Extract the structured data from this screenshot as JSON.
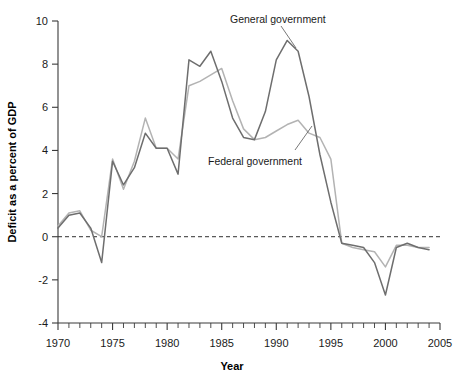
{
  "chart_data": {
    "type": "line",
    "title": "",
    "xlabel": "Year",
    "ylabel": "Deficit as a percent of GDP",
    "xlim": [
      1970,
      2005
    ],
    "ylim": [
      -4,
      10
    ],
    "ytick_labels": [
      "10",
      "8",
      "6",
      "4",
      "2",
      "0",
      "-2",
      "-4"
    ],
    "ytick_values": [
      10,
      8,
      6,
      4,
      2,
      0,
      -2,
      -4
    ],
    "xtick_labels": [
      "1970",
      "1975",
      "1980",
      "1985",
      "1990",
      "1995",
      "2000",
      "2005"
    ],
    "xtick_values": [
      1970,
      1975,
      1980,
      1985,
      1990,
      1995,
      2000,
      2005
    ],
    "grid": false,
    "legend_position": "inline-annotations",
    "zero_reference_line": 0,
    "x": [
      1970,
      1971,
      1972,
      1973,
      1974,
      1975,
      1976,
      1977,
      1978,
      1979,
      1980,
      1981,
      1982,
      1983,
      1984,
      1985,
      1986,
      1987,
      1988,
      1989,
      1990,
      1991,
      1992,
      1993,
      1994,
      1995,
      1996,
      1997,
      1998,
      1999,
      2000,
      2001,
      2002,
      2003,
      2004
    ],
    "series": [
      {
        "name": "General government",
        "color": "#6e6e6e",
        "values": [
          0.4,
          1.0,
          1.1,
          0.4,
          -1.2,
          3.5,
          2.4,
          3.2,
          4.8,
          4.1,
          4.1,
          2.9,
          8.2,
          7.9,
          8.6,
          7.2,
          5.5,
          4.6,
          4.5,
          5.8,
          8.2,
          9.1,
          8.6,
          6.5,
          3.8,
          1.6,
          -0.3,
          -0.4,
          -0.5,
          -1.2,
          -2.7,
          -0.5,
          -0.3,
          -0.5,
          -0.6
        ]
      },
      {
        "name": "Federal government",
        "color": "#b3b3b3",
        "values": [
          0.5,
          1.1,
          1.2,
          0.3,
          0.0,
          3.6,
          2.2,
          3.5,
          5.5,
          4.1,
          4.1,
          3.6,
          7.0,
          7.2,
          7.5,
          7.8,
          6.3,
          5.0,
          4.5,
          4.6,
          4.9,
          5.2,
          5.4,
          4.8,
          4.6,
          3.6,
          -0.3,
          -0.5,
          -0.6,
          -0.7,
          -1.4,
          -0.4,
          -0.4,
          -0.5,
          -0.5
        ]
      }
    ],
    "annotations": [
      {
        "text": "General government",
        "series": "General government"
      },
      {
        "text": "Federal government",
        "series": "Federal government"
      }
    ]
  },
  "axis": {
    "y_title": "Deficit as a percent of GDP",
    "x_title": "Year"
  },
  "annotations": {
    "general": "General government",
    "federal": "Federal government"
  }
}
